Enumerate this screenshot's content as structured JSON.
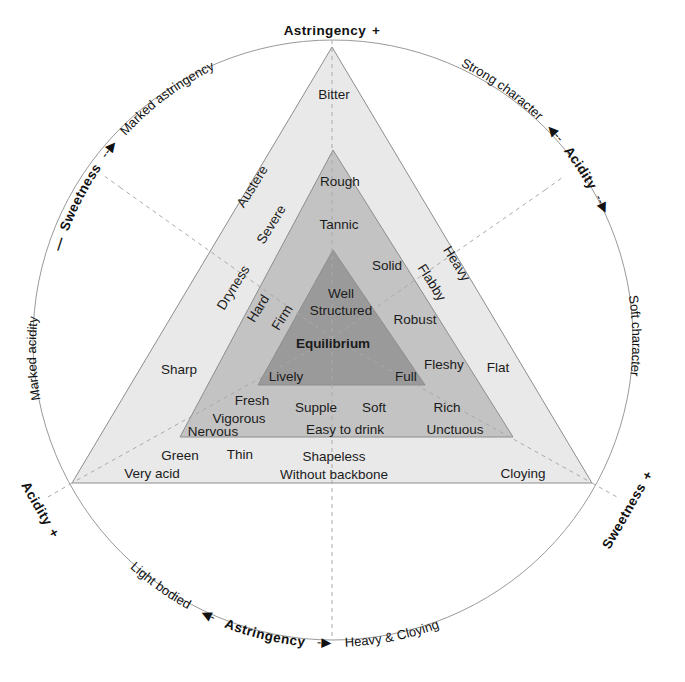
{
  "diagram": {
    "colors": {
      "zone_outer": "#e9e9e9",
      "zone_middle": "#c3c3c3",
      "zone_inner": "#9a9a9a",
      "stroke": "#8d8d8d",
      "dashed": "#a9a9a9",
      "text": "#1b1b1b",
      "background": "#ffffff"
    },
    "circle": {
      "cx": 333,
      "cy": 340,
      "r": 300
    },
    "vertices": {
      "outer": {
        "apex": [
          332,
          47
        ],
        "left": [
          72,
          483
        ],
        "right": [
          592,
          483
        ]
      },
      "middle": {
        "apex": [
          333,
          150
        ],
        "left": [
          180,
          437
        ],
        "right": [
          513,
          437
        ]
      },
      "inner": {
        "apex": [
          333,
          250
        ],
        "left": [
          258,
          385
        ],
        "right": [
          425,
          385
        ]
      }
    }
  },
  "corner_axes": {
    "top": {
      "label": "Astringency",
      "sign": "+"
    },
    "bottom_left": {
      "label": "Acidity",
      "sign": "+"
    },
    "bottom_right": {
      "label": "Sweetness",
      "sign": "+"
    }
  },
  "arc_axes": {
    "top_left": {
      "axis_label": "Sweetness",
      "lead_dash": "—",
      "arrow": "--▶",
      "pole_label": "Marked astringency"
    },
    "top_right": {
      "axis_label": "Acidity",
      "arrow": "◀--",
      "trail_dash": "--▶",
      "pole_label": "Strong character"
    },
    "left": {
      "pole_label": "Marked acidity"
    },
    "right": {
      "pole_label": "Soft character"
    },
    "bottom": {
      "axis_label": "Astringency",
      "left_arrow": "◀-",
      "right_arrow": "-▶",
      "left_pole": "Light bodied",
      "right_pole": "Heavy & Cloying"
    }
  },
  "zones": {
    "outer": {
      "name": "Extreme zone",
      "terms": [
        {
          "text": "Bitter",
          "x": 334,
          "y": 95,
          "rotate": 0,
          "size": 13.5,
          "bold": false
        },
        {
          "text": "Austere",
          "x": 253,
          "y": 187,
          "rotate": -58,
          "size": 13.5,
          "bold": false
        },
        {
          "text": "Severe",
          "x": 272,
          "y": 225,
          "rotate": -58,
          "size": 13.5,
          "bold": false
        },
        {
          "text": "Dryness",
          "x": 234,
          "y": 288,
          "rotate": -58,
          "size": 13.5,
          "bold": false
        },
        {
          "text": "Hard",
          "x": 259,
          "y": 309,
          "rotate": -58,
          "size": 13.5,
          "bold": false
        },
        {
          "text": "Sharp",
          "x": 179,
          "y": 370,
          "rotate": 0,
          "size": 13.5,
          "bold": false
        },
        {
          "text": "Green",
          "x": 180,
          "y": 456,
          "rotate": 0,
          "size": 13.5,
          "bold": false
        },
        {
          "text": "Very acid",
          "x": 152,
          "y": 474,
          "rotate": 0,
          "size": 13.5,
          "bold": false
        },
        {
          "text": "Thin",
          "x": 240,
          "y": 455,
          "rotate": 0,
          "size": 13.5,
          "bold": false
        },
        {
          "text": "Shapeless",
          "x": 334,
          "y": 457,
          "rotate": 0,
          "size": 13.5,
          "bold": false
        },
        {
          "text": "Without backbone",
          "x": 334,
          "y": 475,
          "rotate": 0,
          "size": 13.5,
          "bold": false
        },
        {
          "text": "Cloying",
          "x": 523,
          "y": 474,
          "rotate": 0,
          "size": 13.5,
          "bold": false
        },
        {
          "text": "Flat",
          "x": 498,
          "y": 368,
          "rotate": 0,
          "size": 13.5,
          "bold": false
        },
        {
          "text": "Heavy",
          "x": 456,
          "y": 264,
          "rotate": 58,
          "size": 13.5,
          "bold": false
        }
      ]
    },
    "middle": {
      "name": "Character zone",
      "terms": [
        {
          "text": "Rough",
          "x": 340,
          "y": 182,
          "rotate": 0,
          "size": 13.5,
          "bold": false
        },
        {
          "text": "Tannic",
          "x": 339,
          "y": 225,
          "rotate": 0,
          "size": 13.5,
          "bold": false
        },
        {
          "text": "Firm",
          "x": 283,
          "y": 318,
          "rotate": -58,
          "size": 13.5,
          "bold": false
        },
        {
          "text": "Solid",
          "x": 387,
          "y": 266,
          "rotate": 0,
          "size": 13.5,
          "bold": false
        },
        {
          "text": "Flabby",
          "x": 431,
          "y": 283,
          "rotate": 58,
          "size": 13.5,
          "bold": false
        },
        {
          "text": "Robust",
          "x": 415,
          "y": 320,
          "rotate": 0,
          "size": 13.5,
          "bold": false
        },
        {
          "text": "Fleshy",
          "x": 444,
          "y": 365,
          "rotate": 0,
          "size": 13.5,
          "bold": false
        },
        {
          "text": "Fresh",
          "x": 252,
          "y": 401,
          "rotate": 0,
          "size": 13.5,
          "bold": false
        },
        {
          "text": "Vigorous",
          "x": 239,
          "y": 419,
          "rotate": 0,
          "size": 13.5,
          "bold": false
        },
        {
          "text": "Nervous",
          "x": 213,
          "y": 432,
          "rotate": 0,
          "size": 13.5,
          "bold": false
        },
        {
          "text": "Supple",
          "x": 316,
          "y": 408,
          "rotate": 0,
          "size": 13.5,
          "bold": false
        },
        {
          "text": "Soft",
          "x": 374,
          "y": 408,
          "rotate": 0,
          "size": 13.5,
          "bold": false
        },
        {
          "text": "Rich",
          "x": 447,
          "y": 408,
          "rotate": 0,
          "size": 13.5,
          "bold": false
        },
        {
          "text": "Easy to drink",
          "x": 345,
          "y": 430,
          "rotate": 0,
          "size": 13.5,
          "bold": false
        },
        {
          "text": "Unctuous",
          "x": 455,
          "y": 430,
          "rotate": 0,
          "size": 13.5,
          "bold": false
        }
      ]
    },
    "inner": {
      "name": "Balance zone",
      "terms": [
        {
          "text": "Well",
          "x": 341,
          "y": 294,
          "rotate": 0,
          "size": 13.5,
          "bold": false
        },
        {
          "text": "Structured",
          "x": 341,
          "y": 311,
          "rotate": 0,
          "size": 13.5,
          "bold": false
        },
        {
          "text": "Equilibrium",
          "x": 333,
          "y": 344,
          "rotate": 0,
          "size": 14,
          "bold": true
        },
        {
          "text": "Lively",
          "x": 286,
          "y": 377,
          "rotate": 0,
          "size": 13.5,
          "bold": false
        },
        {
          "text": "Full",
          "x": 406,
          "y": 377,
          "rotate": 0,
          "size": 13.5,
          "bold": false
        }
      ]
    }
  }
}
